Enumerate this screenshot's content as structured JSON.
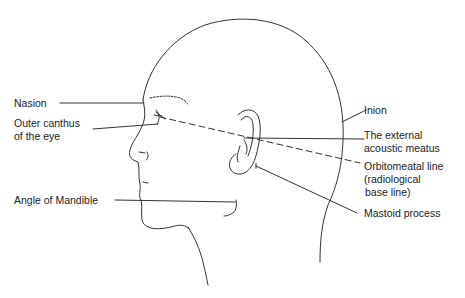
{
  "figure": {
    "stroke_color": "#333333",
    "background": "#ffffff"
  },
  "labels": {
    "nasion": "Nasion",
    "outer_canthus_1": "Outer canthus",
    "outer_canthus_2": "of the eye",
    "angle_of_mandible": "Angle of Mandible",
    "inion": "Inion",
    "external_acoustic_meatus_1": "The external",
    "external_acoustic_meatus_2": "acoustic meatus",
    "orbitomeatal_line_1": "Orbitomeatal line",
    "orbitomeatal_line_2": "(radiological",
    "orbitomeatal_line_3": "base line)",
    "mastoid_process": "Mastoid process"
  }
}
